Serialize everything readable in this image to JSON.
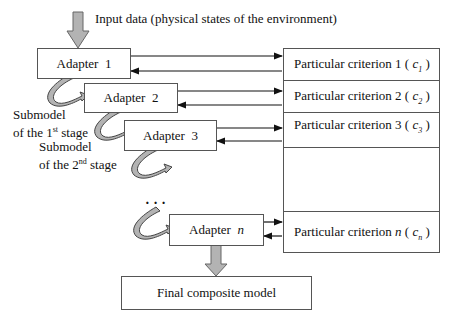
{
  "input_label": "Input data (physical states of the environment)",
  "adapters": [
    {
      "label": "Adapter",
      "num": "1"
    },
    {
      "label": "Adapter",
      "num": "2"
    },
    {
      "label": "Adapter",
      "num": "3"
    },
    {
      "label": "Adapter",
      "num": "n"
    }
  ],
  "criteria": [
    {
      "label": "Particular criterion 1 ( ",
      "sym": "c",
      "sub": "1",
      "close": " )"
    },
    {
      "label": "Particular criterion 2 ( ",
      "sym": "c",
      "sub": "2",
      "close": " )"
    },
    {
      "label": "Particular criterion 3 ( ",
      "sym": "c",
      "sub": "3",
      "close": " )"
    },
    {
      "label": "Particular criterion ",
      "n": "n",
      "paren": " ( ",
      "sym": "c",
      "sub": "n",
      "close": " )"
    }
  ],
  "submodels": [
    {
      "line1": "Submodel",
      "line2a": "of the 1",
      "sup": "st",
      "line2b": " stage"
    },
    {
      "line1": "Submodel",
      "line2a": "of the 2",
      "sup": "nd",
      "line2b": " stage"
    }
  ],
  "ellipsis": "·   ·   ·",
  "final": "Final composite model",
  "colors": {
    "arrow_fill": "#b3b3b3",
    "arrow_stroke": "#666666",
    "line": "#111111",
    "border": "#555555"
  }
}
